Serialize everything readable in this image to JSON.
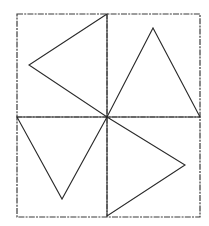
{
  "diagram": {
    "colors": {
      "background": "#ffffff",
      "frame": "#3a3a3a",
      "divider": "#555555",
      "triangle_stroke": "#2a2a2a"
    },
    "frame": {
      "x1": 17,
      "y1": 14,
      "x2": 200,
      "y2": 217
    },
    "center": {
      "x": 107,
      "y": 117
    },
    "dividers": [
      {
        "name": "vertical",
        "x1": 107,
        "y1": 14,
        "x2": 107,
        "y2": 217
      },
      {
        "name": "horizontal",
        "x1": 17,
        "y1": 117,
        "x2": 200,
        "y2": 117
      }
    ],
    "triangles": [
      {
        "name": "top-left",
        "points": "107,14 29,65 107,117"
      },
      {
        "name": "top-right",
        "points": "107,117 153,28 200,117"
      },
      {
        "name": "bottom-left",
        "points": "17,117 62,199 107,117"
      },
      {
        "name": "bottom-right",
        "points": "107,117 185,165 107,216"
      }
    ]
  }
}
